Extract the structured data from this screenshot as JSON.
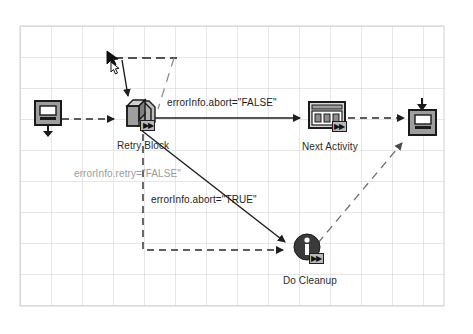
{
  "diagram": {
    "background": "#ffffff",
    "grid": {
      "visible": true,
      "color": "#cfcfd4",
      "cell_size": 31,
      "origin_x": 20,
      "origin_y": 26
    },
    "nodes": [
      {
        "id": "start",
        "label": "",
        "icon": "start-activity-icon",
        "x": 34,
        "y": 100,
        "shape": "monitor-down-arrow"
      },
      {
        "id": "retry-block",
        "label": "Retry Block",
        "icon": "retry-block-stack-icon",
        "badge": "▶▶",
        "x": 119,
        "y": 100,
        "shape": "box-stack"
      },
      {
        "id": "next-activity",
        "label": "Next Activity",
        "icon": "next-activity-window-icon",
        "badge": "▶▶",
        "x": 304,
        "y": 104,
        "shape": "window-three-panes"
      },
      {
        "id": "end",
        "label": "",
        "icon": "end-activity-icon",
        "x": 409,
        "y": 100,
        "shape": "monitor-down-arrow"
      },
      {
        "id": "do-cleanup",
        "label": "Do Cleanup",
        "icon": "info-circle-icon",
        "badge": "▶▶",
        "x": 290,
        "y": 236,
        "shape": "circle-info"
      }
    ],
    "edges": [
      {
        "id": "start-to-retry",
        "from": "start",
        "to": "retry-block",
        "label": "",
        "style": "dashed",
        "color": "#2a2a2a"
      },
      {
        "id": "retry-to-next",
        "from": "retry-block",
        "to": "next-activity",
        "label": "errorInfo.abort=\"FALSE\"",
        "style": "solid",
        "color": "#1e1e1e"
      },
      {
        "id": "next-to-end",
        "from": "next-activity",
        "to": "end",
        "label": "",
        "style": "dashed",
        "color": "#2a2a2a"
      },
      {
        "id": "retry-to-cleanup",
        "from": "retry-block",
        "to": "do-cleanup",
        "label": "errorInfo.abort=\"TRUE\"",
        "style": "solid",
        "color": "#1e1e1e"
      },
      {
        "id": "retry-loopback",
        "from": "retry-block",
        "to": "retry-block",
        "label": "errorInfo.retry=\"FALSE\"",
        "style": "dashed",
        "color": "#2a2a2a"
      },
      {
        "id": "cleanup-to-end",
        "from": "do-cleanup",
        "to": "end",
        "label": "",
        "style": "dashed",
        "color": "#6f6f6f"
      },
      {
        "id": "retry-down-dashed",
        "from": "retry-block",
        "to": "do-cleanup",
        "label": "",
        "style": "dashed",
        "color": "#2a2a2a"
      }
    ],
    "labels": {
      "abort_false": "errorInfo.abort=\"FALSE\"",
      "abort_true": "errorInfo.abort=\"TRUE\"",
      "retry_false": "errorInfo.retry=\"FALSE\"",
      "retry_block": "Retry Block",
      "next_activity": "Next Activity",
      "do_cleanup": "Do Cleanup"
    },
    "cursor": {
      "name": "mouse-pointer",
      "x": 108,
      "y": 55
    },
    "colors": {
      "grid": "#cfcfd4",
      "line_dark": "#1e1e1e",
      "line_gray": "#9b9b9b",
      "icon_fill": "#9e9e9e",
      "icon_stroke": "#1a1a1a",
      "badge_fill": "#b8b8b8",
      "cleanup_fill": "#3a3a3a"
    }
  }
}
